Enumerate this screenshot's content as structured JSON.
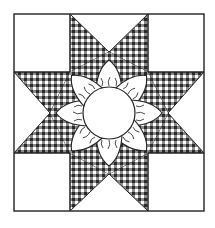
{
  "illustration": {
    "subject": "eight-point star quilt block with flower center",
    "colors": {
      "background": "#ffffff",
      "outline": "#222222",
      "gingham_dark": "#2a2a2a",
      "gingham_mid": "#8a8a8a",
      "gingham_light": "#ffffff",
      "petal_fill": "#ffffff",
      "center_fill": "#ffffff"
    },
    "block": {
      "x": 14,
      "y": 14,
      "width": 190,
      "height": 197,
      "grid_x": [
        70,
        148
      ],
      "grid_y": [
        72,
        153
      ]
    },
    "center_circle": {
      "cx": 109,
      "cy": 113,
      "r": 26
    },
    "petal_count": 8,
    "star_points": 8
  }
}
